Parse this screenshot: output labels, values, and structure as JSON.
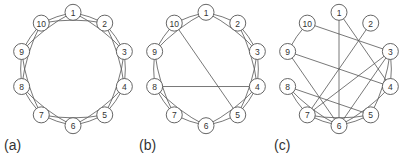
{
  "figure": {
    "panels": [
      {
        "label": "(a)",
        "center": [
          73,
          69
        ],
        "radius": 54,
        "nodes": [
          "1",
          "2",
          "3",
          "4",
          "5",
          "6",
          "7",
          "8",
          "9",
          "10"
        ],
        "edges": [
          [
            1,
            2
          ],
          [
            2,
            3
          ],
          [
            3,
            4
          ],
          [
            4,
            5
          ],
          [
            5,
            6
          ],
          [
            6,
            7
          ],
          [
            7,
            8
          ],
          [
            8,
            9
          ],
          [
            9,
            10
          ],
          [
            10,
            1
          ],
          [
            1,
            3
          ],
          [
            2,
            4
          ],
          [
            3,
            5
          ],
          [
            4,
            6
          ],
          [
            5,
            7
          ],
          [
            6,
            8
          ],
          [
            7,
            9
          ],
          [
            8,
            10
          ],
          [
            9,
            1
          ],
          [
            10,
            2
          ]
        ]
      },
      {
        "label": "(b)",
        "center": [
          206,
          69
        ],
        "radius": 54,
        "nodes": [
          "1",
          "2",
          "3",
          "4",
          "5",
          "6",
          "7",
          "8",
          "9",
          "10"
        ],
        "edges": [
          [
            1,
            2
          ],
          [
            2,
            3
          ],
          [
            3,
            4
          ],
          [
            4,
            5
          ],
          [
            5,
            6
          ],
          [
            6,
            7
          ],
          [
            7,
            8
          ],
          [
            8,
            9
          ],
          [
            9,
            10
          ],
          [
            10,
            1
          ],
          [
            1,
            3
          ],
          [
            2,
            4
          ],
          [
            3,
            5
          ],
          [
            4,
            6
          ],
          [
            6,
            8
          ],
          [
            7,
            9
          ],
          [
            9,
            1
          ],
          [
            4,
            8
          ],
          [
            10,
            5
          ]
        ]
      },
      {
        "label": "(c)",
        "center": [
          339,
          69
        ],
        "radius": 54,
        "nodes": [
          "1",
          "2",
          "3",
          "4",
          "5",
          "6",
          "7",
          "8",
          "9",
          "10"
        ],
        "edges": [
          [
            1,
            6
          ],
          [
            1,
            4
          ],
          [
            10,
            3
          ],
          [
            10,
            9
          ],
          [
            2,
            7
          ],
          [
            9,
            4
          ],
          [
            9,
            6
          ],
          [
            3,
            4
          ],
          [
            3,
            7
          ],
          [
            3,
            6
          ],
          [
            4,
            6
          ],
          [
            8,
            5
          ],
          [
            8,
            6
          ],
          [
            8,
            7
          ],
          [
            7,
            6
          ],
          [
            7,
            5
          ],
          [
            6,
            5
          ],
          [
            3,
            5
          ]
        ]
      }
    ]
  }
}
